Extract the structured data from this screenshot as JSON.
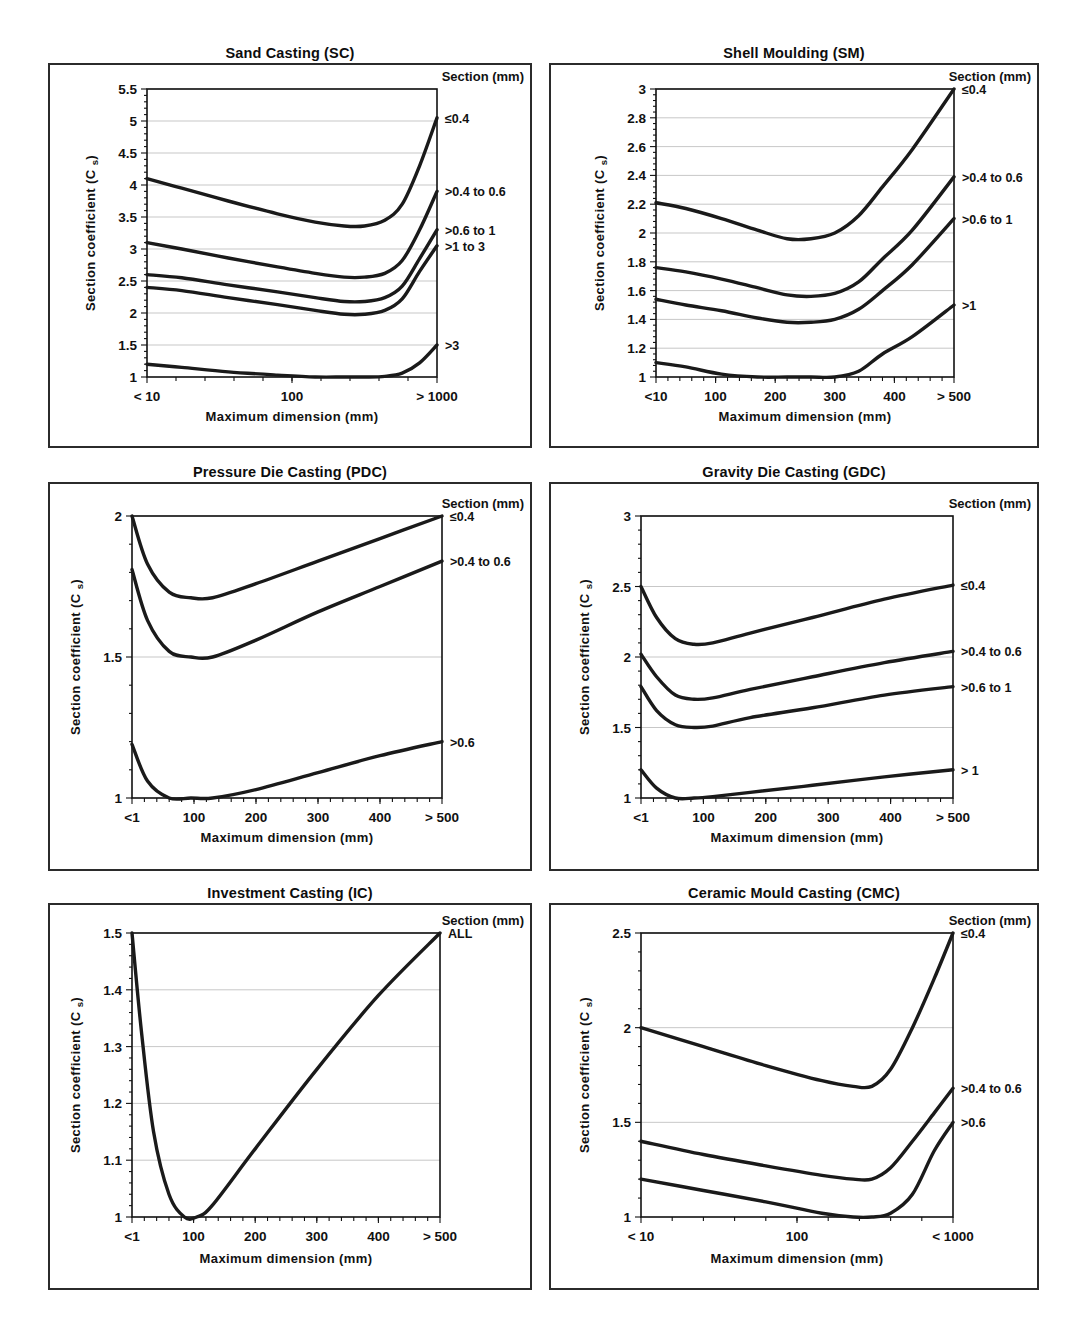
{
  "page": {
    "running_head": ""
  },
  "common": {
    "legend_header": "Section (mm)",
    "ylabel_main": "Section coefficient (C",
    "ylabel_sub": "s",
    "ylabel_close": ")",
    "xlabel": "Maximum dimension (mm)"
  },
  "chart_data": [
    {
      "id": "sand-casting",
      "type": "line",
      "title": "Sand Casting (SC)",
      "xlabel": "Maximum dimension (mm)",
      "ylabel": "Section coefficient (C s)",
      "legend_title": "Section (mm)",
      "legend_position": "right",
      "grid": true,
      "xscale": "log",
      "xticks": [
        "< 10",
        "100",
        "> 1000"
      ],
      "xtickpos": [
        0,
        0.5,
        1
      ],
      "ylim": [
        1,
        5.5
      ],
      "yticks": [
        1,
        1.5,
        2,
        2.5,
        3,
        3.5,
        4,
        4.5,
        5,
        5.5
      ],
      "yticklabels": [
        "1",
        "1.5",
        "2",
        "2.5",
        "3",
        "3.5",
        "4",
        "4.5",
        "5",
        "5.5"
      ],
      "series": [
        {
          "name": "≤0.4",
          "x": [
            0,
            0.12,
            0.28,
            0.45,
            0.58,
            0.68,
            0.75,
            0.82,
            0.88,
            0.94,
            1.0
          ],
          "values": [
            4.1,
            3.95,
            3.75,
            3.55,
            3.42,
            3.36,
            3.36,
            3.45,
            3.7,
            4.3,
            5.05
          ]
        },
        {
          "name": ">0.4 to 0.6",
          "x": [
            0,
            0.12,
            0.28,
            0.45,
            0.58,
            0.68,
            0.75,
            0.82,
            0.88,
            0.94,
            1.0
          ],
          "values": [
            3.1,
            3.0,
            2.86,
            2.72,
            2.62,
            2.56,
            2.56,
            2.62,
            2.82,
            3.3,
            3.9
          ]
        },
        {
          "name": ">0.6 to 1",
          "x": [
            0,
            0.12,
            0.28,
            0.45,
            0.58,
            0.68,
            0.75,
            0.82,
            0.88,
            0.94,
            1.0
          ],
          "values": [
            2.6,
            2.55,
            2.44,
            2.33,
            2.24,
            2.18,
            2.18,
            2.24,
            2.42,
            2.85,
            3.3
          ]
        },
        {
          "name": ">1 to 3",
          "x": [
            0,
            0.12,
            0.28,
            0.45,
            0.58,
            0.68,
            0.75,
            0.82,
            0.88,
            0.94,
            1.0
          ],
          "values": [
            2.4,
            2.35,
            2.24,
            2.13,
            2.04,
            1.98,
            1.98,
            2.04,
            2.22,
            2.65,
            3.05
          ]
        },
        {
          "name": ">3",
          "x": [
            0,
            0.12,
            0.28,
            0.45,
            0.58,
            0.68,
            0.75,
            0.82,
            0.88,
            0.94,
            1.0
          ],
          "values": [
            1.2,
            1.15,
            1.08,
            1.03,
            1.0,
            1.0,
            1.0,
            1.01,
            1.06,
            1.22,
            1.5
          ]
        }
      ]
    },
    {
      "id": "shell-moulding",
      "type": "line",
      "title": "Shell Moulding (SM)",
      "xlabel": "Maximum dimension (mm)",
      "ylabel": "Section coefficient (C s)",
      "legend_title": "Section (mm)",
      "legend_position": "right",
      "grid": true,
      "xscale": "linear",
      "xticks": [
        "<10",
        "100",
        "200",
        "300",
        "400",
        "> 500"
      ],
      "xtickpos": [
        0,
        0.2,
        0.4,
        0.6,
        0.8,
        1
      ],
      "ylim": [
        1,
        3
      ],
      "yticks": [
        1,
        1.2,
        1.4,
        1.6,
        1.8,
        2,
        2.2,
        2.4,
        2.6,
        2.8,
        3
      ],
      "yticklabels": [
        "1",
        "1.2",
        "1.4",
        "1.6",
        "1.8",
        "2",
        "2.2",
        "2.4",
        "2.6",
        "2.8",
        "3"
      ],
      "series": [
        {
          "name": "≤0.4",
          "x": [
            0,
            0.1,
            0.22,
            0.34,
            0.44,
            0.52,
            0.6,
            0.68,
            0.76,
            0.86,
            1.0
          ],
          "values": [
            2.21,
            2.17,
            2.1,
            2.02,
            1.96,
            1.96,
            2.0,
            2.12,
            2.32,
            2.58,
            3.0
          ]
        },
        {
          "name": ">0.4 to 0.6",
          "x": [
            0,
            0.1,
            0.22,
            0.34,
            0.44,
            0.52,
            0.6,
            0.68,
            0.76,
            0.86,
            1.0
          ],
          "values": [
            1.76,
            1.73,
            1.68,
            1.62,
            1.57,
            1.56,
            1.58,
            1.66,
            1.82,
            2.02,
            2.39
          ]
        },
        {
          "name": ">0.6 to 1",
          "x": [
            0,
            0.1,
            0.22,
            0.34,
            0.44,
            0.52,
            0.6,
            0.68,
            0.76,
            0.86,
            1.0
          ],
          "values": [
            1.54,
            1.5,
            1.46,
            1.41,
            1.38,
            1.38,
            1.4,
            1.47,
            1.6,
            1.78,
            2.1
          ]
        },
        {
          "name": ">1",
          "x": [
            0,
            0.1,
            0.22,
            0.34,
            0.44,
            0.52,
            0.6,
            0.68,
            0.76,
            0.86,
            1.0
          ],
          "values": [
            1.1,
            1.07,
            1.02,
            1.0,
            1.0,
            1.0,
            1.0,
            1.04,
            1.16,
            1.28,
            1.5
          ]
        }
      ]
    },
    {
      "id": "pressure-die-casting",
      "type": "line",
      "title": "Pressure Die Casting (PDC)",
      "xlabel": "Maximum dimension (mm)",
      "ylabel": "Section coefficient (C s)",
      "legend_title": "Section (mm)",
      "legend_position": "right",
      "grid": true,
      "xscale": "linear",
      "xticks": [
        "<1",
        "100",
        "200",
        "300",
        "400",
        "> 500"
      ],
      "xtickpos": [
        0,
        0.2,
        0.4,
        0.6,
        0.8,
        1
      ],
      "ylim": [
        1,
        2
      ],
      "yticks": [
        1,
        1.5,
        2
      ],
      "yticklabels": [
        "1",
        "1.5",
        "2"
      ],
      "series": [
        {
          "name": "≤0.4",
          "x": [
            0,
            0.05,
            0.12,
            0.19,
            0.26,
            0.4,
            0.6,
            0.8,
            1.0
          ],
          "values": [
            2.0,
            1.83,
            1.73,
            1.71,
            1.71,
            1.76,
            1.84,
            1.92,
            2.0
          ]
        },
        {
          "name": ">0.4 to 0.6",
          "x": [
            0,
            0.05,
            0.12,
            0.19,
            0.26,
            0.4,
            0.6,
            0.8,
            1.0
          ],
          "values": [
            1.81,
            1.63,
            1.52,
            1.5,
            1.5,
            1.56,
            1.66,
            1.75,
            1.84
          ]
        },
        {
          "name": ">0.6",
          "x": [
            0,
            0.05,
            0.12,
            0.19,
            0.26,
            0.4,
            0.6,
            0.8,
            1.0
          ],
          "values": [
            1.19,
            1.06,
            1.0,
            1.0,
            1.0,
            1.03,
            1.09,
            1.15,
            1.2
          ]
        }
      ]
    },
    {
      "id": "gravity-die-casting",
      "type": "line",
      "title": "Gravity Die Casting (GDC)",
      "xlabel": "Maximum dimension (mm)",
      "ylabel": "Section coefficient (C s)",
      "legend_title": "Section (mm)",
      "legend_position": "right",
      "grid": true,
      "xscale": "linear",
      "xticks": [
        "<1",
        "100",
        "200",
        "300",
        "400",
        "> 500"
      ],
      "xtickpos": [
        0,
        0.2,
        0.4,
        0.6,
        0.8,
        1
      ],
      "ylim": [
        1,
        3
      ],
      "yticks": [
        1,
        1.5,
        2,
        2.5,
        3
      ],
      "yticklabels": [
        "1",
        "1.5",
        "2",
        "2.5",
        "3"
      ],
      "series": [
        {
          "name": "≤0.4",
          "x": [
            0,
            0.05,
            0.11,
            0.17,
            0.23,
            0.35,
            0.55,
            0.78,
            1.0
          ],
          "values": [
            2.5,
            2.28,
            2.13,
            2.09,
            2.1,
            2.17,
            2.28,
            2.41,
            2.51
          ]
        },
        {
          "name": ">0.4 to 0.6",
          "x": [
            0,
            0.05,
            0.11,
            0.17,
            0.23,
            0.35,
            0.55,
            0.78,
            1.0
          ],
          "values": [
            2.02,
            1.86,
            1.73,
            1.7,
            1.71,
            1.77,
            1.86,
            1.96,
            2.04
          ]
        },
        {
          "name": ">0.6 to 1",
          "x": [
            0,
            0.05,
            0.11,
            0.17,
            0.23,
            0.35,
            0.55,
            0.78,
            1.0
          ],
          "values": [
            1.79,
            1.62,
            1.52,
            1.5,
            1.51,
            1.57,
            1.64,
            1.73,
            1.79
          ]
        },
        {
          "name": "> 1",
          "x": [
            0,
            0.05,
            0.11,
            0.17,
            0.23,
            0.35,
            0.55,
            0.78,
            1.0
          ],
          "values": [
            1.2,
            1.07,
            1.0,
            1.0,
            1.01,
            1.04,
            1.09,
            1.15,
            1.2
          ]
        }
      ]
    },
    {
      "id": "investment-casting",
      "type": "line",
      "title": "Investment Casting (IC)",
      "xlabel": "Maximum dimension (mm)",
      "ylabel": "Section coefficient (C s)",
      "legend_title": "Section (mm)",
      "legend_position": "right",
      "grid": true,
      "xscale": "linear",
      "xticks": [
        "<1",
        "100",
        "200",
        "300",
        "400",
        "> 500"
      ],
      "xtickpos": [
        0,
        0.2,
        0.4,
        0.6,
        0.8,
        1
      ],
      "ylim": [
        1,
        1.5
      ],
      "yticks": [
        1,
        1.1,
        1.2,
        1.3,
        1.4,
        1.5
      ],
      "yticklabels": [
        "1",
        "1.1",
        "1.2",
        "1.3",
        "1.4",
        "1.5"
      ],
      "series": [
        {
          "name": "ALL",
          "x": [
            0,
            0.03,
            0.07,
            0.12,
            0.17,
            0.21,
            0.26,
            0.4,
            0.6,
            0.8,
            1.0
          ],
          "values": [
            1.5,
            1.33,
            1.15,
            1.04,
            1.0,
            1.0,
            1.02,
            1.12,
            1.26,
            1.39,
            1.5
          ]
        }
      ]
    },
    {
      "id": "ceramic-mould-casting",
      "type": "line",
      "title": "Ceramic Mould Casting (CMC)",
      "xlabel": "Maximum dimension (mm)",
      "ylabel": "Section coefficient (C s)",
      "legend_title": "Section (mm)",
      "legend_position": "right",
      "grid": true,
      "xscale": "log",
      "xticks": [
        "< 10",
        "100",
        "< 1000"
      ],
      "xtickpos": [
        0,
        0.5,
        1
      ],
      "ylim": [
        1,
        2.5
      ],
      "yticks": [
        1,
        1.5,
        2,
        2.5
      ],
      "yticklabels": [
        "1",
        "1.5",
        "2",
        "2.5"
      ],
      "series": [
        {
          "name": "≤0.4",
          "x": [
            0,
            0.2,
            0.4,
            0.58,
            0.68,
            0.74,
            0.8,
            0.87,
            0.94,
            1.0
          ],
          "values": [
            2.0,
            1.9,
            1.8,
            1.72,
            1.69,
            1.69,
            1.78,
            2.0,
            2.26,
            2.5
          ]
        },
        {
          "name": ">0.4 to 0.6",
          "x": [
            0,
            0.2,
            0.4,
            0.58,
            0.68,
            0.74,
            0.8,
            0.87,
            0.94,
            1.0
          ],
          "values": [
            1.4,
            1.33,
            1.27,
            1.22,
            1.2,
            1.2,
            1.26,
            1.4,
            1.55,
            1.68
          ]
        },
        {
          "name": ">0.6",
          "x": [
            0,
            0.2,
            0.4,
            0.58,
            0.68,
            0.74,
            0.8,
            0.87,
            0.94,
            1.0
          ],
          "values": [
            1.2,
            1.14,
            1.08,
            1.02,
            1.0,
            1.0,
            1.02,
            1.12,
            1.35,
            1.5
          ]
        }
      ]
    }
  ],
  "layout": {
    "panels": [
      {
        "left": 48,
        "top": 68,
        "w": 484,
        "h": 385,
        "title_top": 44
      },
      {
        "left": 549,
        "top": 68,
        "w": 490,
        "h": 385,
        "title_top": 44
      },
      {
        "left": 48,
        "top": 487,
        "w": 484,
        "h": 389,
        "title_top": 463
      },
      {
        "left": 549,
        "top": 487,
        "w": 490,
        "h": 389,
        "title_top": 463
      },
      {
        "left": 48,
        "top": 908,
        "w": 484,
        "h": 387,
        "title_top": 884
      },
      {
        "left": 549,
        "top": 908,
        "w": 490,
        "h": 387,
        "title_top": 884
      }
    ],
    "plots": [
      {
        "x": 97,
        "y": 24,
        "w": 290,
        "h": 288,
        "legend_x": 300,
        "xlab_y": 356
      },
      {
        "x": 105,
        "y": 24,
        "w": 298,
        "h": 288,
        "legend_x": 310,
        "xlab_y": 356
      },
      {
        "x": 82,
        "y": 32,
        "w": 310,
        "h": 282,
        "legend_x": 315,
        "xlab_y": 358
      },
      {
        "x": 90,
        "y": 32,
        "w": 312,
        "h": 282,
        "legend_x": 318,
        "xlab_y": 358
      },
      {
        "x": 82,
        "y": 28,
        "w": 308,
        "h": 284,
        "legend_x": 313,
        "xlab_y": 358
      },
      {
        "x": 90,
        "y": 28,
        "w": 312,
        "h": 284,
        "legend_x": 316,
        "xlab_y": 358
      }
    ],
    "label_y": [
      [
        5.05,
        3.9,
        3.3,
        3.05,
        1.5
      ],
      [
        3.0,
        2.39,
        2.1,
        1.5
      ],
      [
        2.0,
        1.84,
        1.2
      ],
      [
        2.51,
        2.04,
        1.79,
        1.2
      ],
      [
        1.5
      ],
      [
        2.5,
        1.68,
        1.5
      ]
    ]
  }
}
